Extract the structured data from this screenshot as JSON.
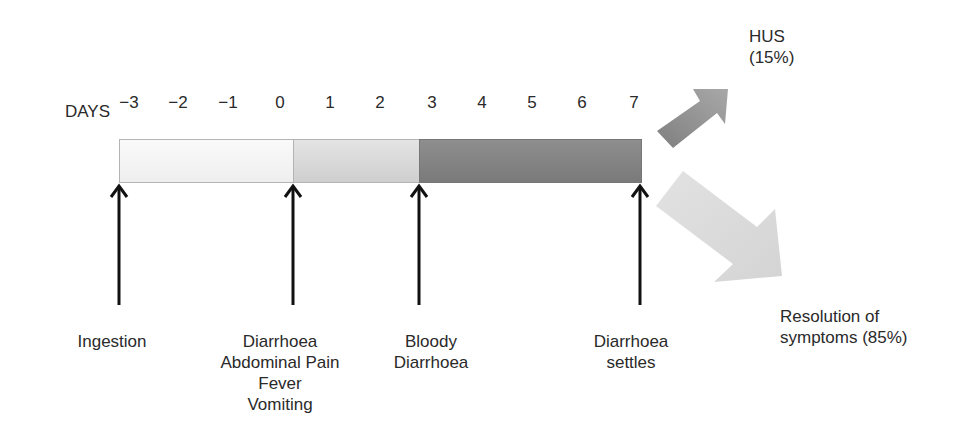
{
  "axis": {
    "label": "DAYS",
    "ticks": [
      {
        "label": "−3",
        "x": 129
      },
      {
        "label": "−2",
        "x": 178
      },
      {
        "label": "−1",
        "x": 228
      },
      {
        "label": "0",
        "x": 280
      },
      {
        "label": "1",
        "x": 330
      },
      {
        "label": "2",
        "x": 380
      },
      {
        "label": "3",
        "x": 432
      },
      {
        "label": "4",
        "x": 482
      },
      {
        "label": "5",
        "x": 532
      },
      {
        "label": "6",
        "x": 582
      },
      {
        "label": "7",
        "x": 634
      }
    ]
  },
  "timeline_segments": [
    {
      "name": "incubation",
      "shade": "#f4f4f4"
    },
    {
      "name": "early-symptoms",
      "shade": "#d9d9d9"
    },
    {
      "name": "bloody-diarrhoea-phase",
      "shade": "#838383"
    }
  ],
  "events": [
    {
      "id": "ingestion",
      "lines": [
        "Ingestion"
      ]
    },
    {
      "id": "diarrhoea-onset",
      "lines": [
        "Diarrhoea",
        "Abdominal Pain",
        "Fever",
        "Vomiting"
      ]
    },
    {
      "id": "bloody-diarrhoea",
      "lines": [
        "Bloody",
        "Diarrhoea"
      ]
    },
    {
      "id": "diarrhoea-settles",
      "lines": [
        "Diarrhoea",
        "settles"
      ]
    }
  ],
  "outcomes": {
    "hus": {
      "line1": "HUS",
      "line2": "(15%)",
      "color": "#8a8a8a"
    },
    "resolution": {
      "line1": "Resolution of",
      "line2": "symptoms (85%)",
      "color": "#dcdcdc"
    }
  }
}
